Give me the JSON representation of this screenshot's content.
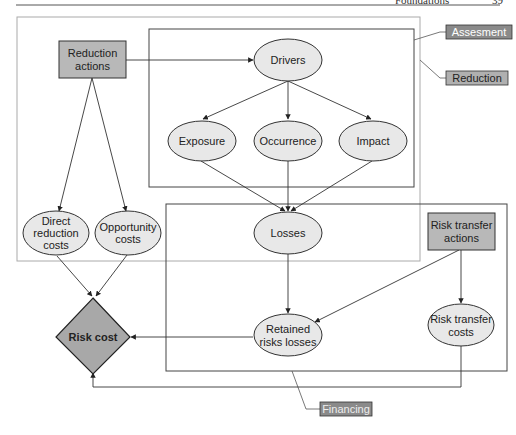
{
  "header": {
    "running_title": "Foundations",
    "page_number": "39"
  },
  "colors": {
    "ellipse_fill": "#e8e8e8",
    "action_fill": "#b8b8b8",
    "diamond_fill": "#a8a8a8",
    "label_tag_dark": "#8a8a8a",
    "label_tag_light": "#b0b0b0",
    "stroke": "#333333",
    "outer_frame": "#aaaaaa"
  },
  "regions": {
    "assesment": "Assesment",
    "reduction": "Reduction",
    "financing": "Financing"
  },
  "nodes": {
    "reduction_actions": [
      "Reduction",
      "actions"
    ],
    "drivers": "Drivers",
    "exposure": "Exposure",
    "occurrence": "Occurrence",
    "impact": "Impact",
    "direct_reduction_costs": [
      "Direct",
      "reduction",
      "costs"
    ],
    "opportunity_costs": [
      "Opportunity",
      "costs"
    ],
    "losses": "Losses",
    "risk_transfer_actions": [
      "Risk transfer",
      "actions"
    ],
    "retained_risks_losses": [
      "Retained",
      "risks losses"
    ],
    "risk_transfer_costs": [
      "Risk transfer",
      "costs"
    ],
    "risk_cost": "Risk cost"
  }
}
